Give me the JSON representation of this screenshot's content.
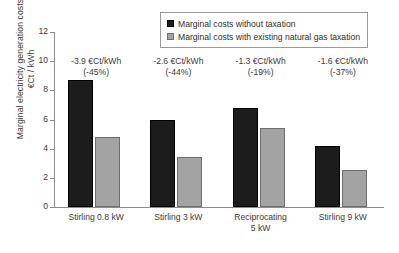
{
  "chart_data": {
    "type": "bar",
    "title": "",
    "xlabel": "",
    "ylabel": "Marginal electricity generation costs €Ct / kWh",
    "ylabel_line1": "Marginal electricity generation costs",
    "ylabel_line2": "€Ct / kWh",
    "ylim": [
      0,
      12
    ],
    "yticks": [
      0,
      2,
      4,
      6,
      8,
      10,
      12
    ],
    "ytick_labels": [
      "0",
      "2",
      "4",
      "6",
      "8",
      "10",
      "12"
    ],
    "grid": false,
    "legend_position": "top-right",
    "categories": [
      "Stirling 0.8 kW",
      "Stirling 3 kW",
      "Reciprocating 5 kW",
      "Stirling 9 kW"
    ],
    "category_lines": [
      [
        "Stirling 0.8 kW"
      ],
      [
        "Stirling 3 kW"
      ],
      [
        "Reciprocating",
        "5 kW"
      ],
      [
        "Stirling 9 kW"
      ]
    ],
    "series": [
      {
        "name": "Marginal costs without taxation",
        "color": "#1c1c1c",
        "values": [
          8.7,
          6.0,
          6.8,
          4.2
        ]
      },
      {
        "name": "Marginal costs with existing natural gas taxation",
        "color": "#a3a3a3",
        "values": [
          4.8,
          3.4,
          5.45,
          2.55
        ]
      }
    ],
    "annotations": [
      {
        "line1": "-3.9 €Ct/kWh",
        "line2": "(-45%)",
        "delta": -3.9,
        "percent": -45
      },
      {
        "line1": "-2.6 €Ct/kWh",
        "line2": "(-44%)",
        "delta": -2.6,
        "percent": -44
      },
      {
        "line1": "-1.3 €Ct/kWh",
        "line2": "(-19%)",
        "delta": -1.3,
        "percent": -19
      },
      {
        "line1": "-1.6 €Ct/kWh",
        "line2": "(-37%)",
        "delta": -1.6,
        "percent": -37
      }
    ]
  },
  "legend": {
    "items": [
      {
        "label": "Marginal costs without taxation",
        "swatch": "dark"
      },
      {
        "label": "Marginal costs with existing natural gas taxation",
        "swatch": "light"
      }
    ]
  }
}
